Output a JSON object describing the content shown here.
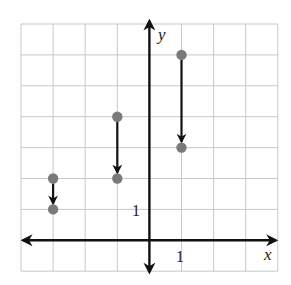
{
  "chart_data": {
    "type": "scatter",
    "title": "",
    "xlabel": "x",
    "ylabel": "y",
    "xlim": [
      -4,
      4
    ],
    "ylim": [
      -1,
      7
    ],
    "grid": true,
    "tick_labels": {
      "x": [
        "1"
      ],
      "y": [
        "1"
      ]
    },
    "points": [
      {
        "x": -3,
        "y": 2
      },
      {
        "x": -3,
        "y": 1
      },
      {
        "x": -1,
        "y": 4
      },
      {
        "x": -1,
        "y": 2
      },
      {
        "x": 1,
        "y": 6
      },
      {
        "x": 1,
        "y": 3
      }
    ],
    "arrows": [
      {
        "from": [
          -3,
          2
        ],
        "to": [
          -3,
          1
        ]
      },
      {
        "from": [
          -1,
          4
        ],
        "to": [
          -1,
          2
        ]
      },
      {
        "from": [
          1,
          6
        ],
        "to": [
          1,
          3
        ]
      }
    ],
    "colors": {
      "point": "#7a7a7a",
      "axis": "#111111",
      "grid": "#c8c8c8",
      "arrow": "#111111"
    }
  },
  "labels": {
    "x_axis": "x",
    "y_axis": "y",
    "x_tick": "1",
    "y_tick": "1"
  }
}
